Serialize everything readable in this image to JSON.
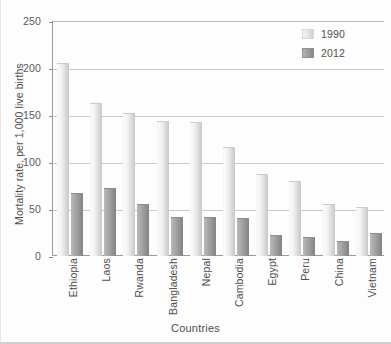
{
  "chart_data": {
    "type": "bar",
    "title": "",
    "xlabel": "Countries",
    "ylabel": "Mortality rate, per 1,000 live births",
    "ylim": [
      0,
      250
    ],
    "ytick_step": 50,
    "yticks": [
      0,
      50,
      100,
      150,
      200,
      250
    ],
    "ytick_labels": [
      "0",
      "50",
      "100",
      "150",
      "200",
      "250"
    ],
    "grid": true,
    "grid_axis": "y",
    "legend_position": "top-right",
    "categories": [
      "Ethiopia",
      "Laos",
      "Rwanda",
      "Bangladesh",
      "Nepal",
      "Cambodia",
      "Egypt",
      "Peru",
      "China",
      "Vietnam"
    ],
    "series": [
      {
        "name": "1990",
        "color": "#e6e6e6",
        "values": [
          205,
          163,
          152,
          144,
          143,
          116,
          87,
          80,
          55,
          52
        ]
      },
      {
        "name": "2012",
        "color": "#9b9b9b",
        "values": [
          67,
          72,
          55,
          41,
          42,
          40,
          22,
          20,
          16,
          24
        ]
      }
    ]
  },
  "legend": {
    "items": [
      {
        "label": "1990"
      },
      {
        "label": "2012"
      }
    ]
  },
  "axes": {
    "x_title": "Countries",
    "y_title": "Mortality rate, per 1,000 live births"
  }
}
